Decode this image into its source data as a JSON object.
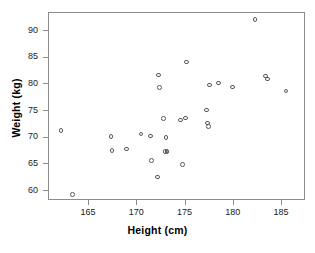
{
  "chart_data": {
    "type": "scatter",
    "title": "",
    "xlabel": "Height (cm)",
    "ylabel": "Weight (kg)",
    "xlim": [
      161.5,
      188.0
    ],
    "ylim": [
      57.5,
      93.0
    ],
    "xticks": [
      165,
      170,
      175,
      180,
      185
    ],
    "yticks": [
      60,
      65,
      70,
      75,
      80,
      85,
      90
    ],
    "xtick_labels": [
      "165",
      "170",
      "175",
      "180",
      "185"
    ],
    "ytick_labels": [
      "60",
      "65",
      "70",
      "75",
      "80",
      "85",
      "90"
    ],
    "grid": false,
    "legend": null,
    "marker": "open-circle",
    "marker_color": "#5a5a5a",
    "frame_color": "#8c8c8c",
    "n_points": 30,
    "x": [
      162.2,
      163.4,
      167.4,
      167.5,
      169.0,
      170.5,
      171.5,
      171.6,
      172.2,
      172.3,
      172.4,
      172.8,
      173.1,
      173.2,
      173.2,
      174.6,
      174.8,
      175.1,
      175.2,
      177.3,
      177.4,
      177.5,
      177.6,
      178.5,
      180.0,
      182.3,
      183.4,
      183.6,
      185.5,
      173.0
    ],
    "y": [
      71.2,
      59.2,
      70.0,
      67.4,
      67.7,
      70.5,
      70.1,
      65.5,
      62.4,
      81.6,
      79.2,
      73.4,
      69.8,
      67.3,
      67.1,
      73.1,
      64.8,
      73.5,
      84.0,
      75.0,
      72.6,
      71.9,
      79.7,
      80.1,
      79.3,
      92.0,
      81.4,
      80.8,
      78.6,
      67.2
    ]
  },
  "axes": {
    "x_title": "Height (cm)",
    "y_title": "Weight (kg)"
  }
}
